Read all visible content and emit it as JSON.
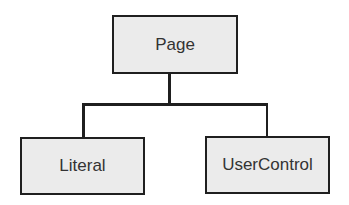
{
  "diagram": {
    "type": "hierarchy",
    "root": {
      "label": "Page",
      "children": [
        {
          "label": "Literal"
        },
        {
          "label": "UserControl"
        }
      ]
    },
    "colors": {
      "node_fill": "#ebebeb",
      "node_border": "#1f1f1f",
      "connector": "#1f1f1f",
      "text": "#333333"
    }
  }
}
